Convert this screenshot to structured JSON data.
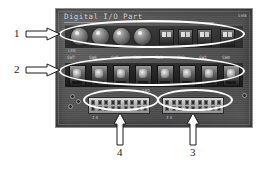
{
  "figure": {
    "type": "annotated-photograph",
    "width": 263,
    "height": 169,
    "background_color": "#ffffff"
  },
  "board": {
    "title": "Digital I/O Part",
    "silkscreen_color": "#d9d9d9",
    "pcb_color": "#565656",
    "corner_label": "SW8",
    "led_row_label": "LED",
    "switch_labels": [
      "SW7",
      "SW6",
      "SW5",
      "SW4",
      "SW3",
      "SW2",
      "SW1",
      "SW0"
    ],
    "connector_left_caption": "J4",
    "connector_right_caption": "J3",
    "mid_label": "GND"
  },
  "annotations": {
    "ellipse_color": "#ffffff",
    "callouts": [
      {
        "number": "1",
        "direction": "right",
        "target": "led-row"
      },
      {
        "number": "2",
        "direction": "right",
        "target": "switch-row"
      },
      {
        "number": "3",
        "direction": "up",
        "target": "right-pin-header"
      },
      {
        "number": "4",
        "direction": "up",
        "target": "left-pin-header"
      }
    ]
  },
  "components": {
    "leds_large_count": 4,
    "leds_small_count": 4,
    "switch_count": 8,
    "header_pins_per_row": 9,
    "header_rows": 2
  }
}
